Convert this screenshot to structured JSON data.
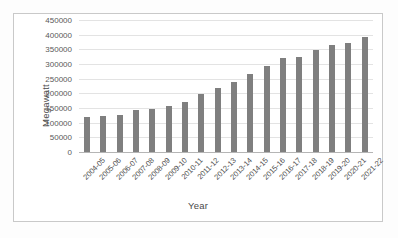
{
  "chart_data": {
    "type": "bar",
    "title": "",
    "xlabel": "Year",
    "ylabel": "Megawatt",
    "ylim": [
      0,
      450000
    ],
    "ytick_step": 50000,
    "yticks": [
      "450000",
      "400000",
      "350000",
      "300000",
      "250000",
      "200000",
      "150000",
      "100000",
      "50000",
      "0"
    ],
    "grid": true,
    "legend": "none",
    "bar_color": "#7f7f7f",
    "categories": [
      "2004-05",
      "2005-06",
      "2006-07",
      "2007-08",
      "2008-09",
      "2009-10",
      "2010-11",
      "2011-12",
      "2012-13",
      "2013-14",
      "2014-15",
      "2015-16",
      "2016-17",
      "2017-18",
      "2018-19",
      "2019-20",
      "2020-21",
      "2021-22"
    ],
    "values": [
      118000,
      123000,
      127000,
      142000,
      147000,
      156000,
      169000,
      197000,
      218000,
      240000,
      267000,
      292000,
      320000,
      324000,
      349000,
      364000,
      373000,
      392000
    ]
  }
}
